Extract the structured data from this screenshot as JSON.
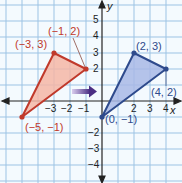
{
  "diagram": {
    "axes": {
      "x_label": "x",
      "y_label": "y",
      "x_ticks": [
        "−3",
        "−2",
        "−1",
        "2",
        "3",
        "4"
      ],
      "y_ticks": [
        "5",
        "4",
        "3",
        "2",
        "−2",
        "−3",
        "−4"
      ]
    },
    "preimage": {
      "color": "#c0392b",
      "fill": "#f4b6a6",
      "vertices": [
        {
          "label": "(−3, 3)",
          "x": -3,
          "y": 3
        },
        {
          "label": "(−1, 2)",
          "x": -1,
          "y": 2
        },
        {
          "label": "(−5, −1)",
          "x": -5,
          "y": -1
        }
      ]
    },
    "image": {
      "color": "#2e4a8c",
      "fill": "#a8b8e6",
      "vertices": [
        {
          "label": "(2, 3)",
          "x": 2,
          "y": 3
        },
        {
          "label": "(4, 2)",
          "x": 4,
          "y": 2
        },
        {
          "label": "(0, −1)",
          "x": 0,
          "y": -1
        }
      ]
    },
    "arrow": {
      "direction": "right",
      "color": "#4b2e83"
    }
  }
}
